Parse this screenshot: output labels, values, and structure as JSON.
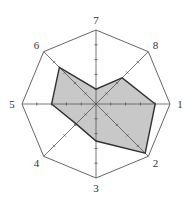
{
  "chart_data": {
    "type": "radar",
    "title": "",
    "axes": [
      "1",
      "2",
      "3",
      "4",
      "5",
      "6",
      "7",
      "8"
    ],
    "values": [
      4,
      4.7,
      2.5,
      1.9,
      3,
      3.5,
      1,
      2.5
    ],
    "scale": {
      "min": 0,
      "max": 5,
      "ticks": [
        1,
        2,
        3,
        4
      ]
    },
    "grid": "octagon outer frame with tick marks on each axis",
    "legend": "none",
    "fill_color": "#c8c8c8",
    "line_color": "#333333",
    "frame_color": "#555555"
  }
}
